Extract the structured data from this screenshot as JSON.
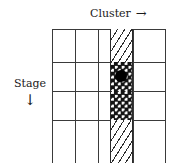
{
  "figure": {
    "width": 185,
    "height": 163,
    "background_color": "#ffffff",
    "line_color": "#3a3a3a",
    "marker_color": "#000000"
  },
  "axes": {
    "horizontal": {
      "label": "Cluster",
      "arrow": "→",
      "arrow_icon_name": "arrow-right-icon",
      "direction": "right",
      "position": "top"
    },
    "vertical": {
      "label": "Stage",
      "arrow": "↓",
      "arrow_icon_name": "arrow-down-icon",
      "direction": "down",
      "position": "left"
    }
  },
  "grid": {
    "columns": 5,
    "rows": 4,
    "bottom_row_clipped": true,
    "marked_column_index": 4,
    "marker": {
      "label": "selected-cell-marker",
      "shape": "filled-circle",
      "column": 4,
      "row": 2,
      "color": "#000000"
    },
    "bands": [
      {
        "name": "band-top",
        "row": 1,
        "fill": "diagonal-hatch"
      },
      {
        "name": "band-mid-a",
        "row": 2,
        "fill": "dotted"
      },
      {
        "name": "band-mid-b",
        "row": 3,
        "fill": "dotted"
      },
      {
        "name": "band-bottom",
        "row": 4,
        "fill": "diagonal-hatch"
      }
    ]
  }
}
